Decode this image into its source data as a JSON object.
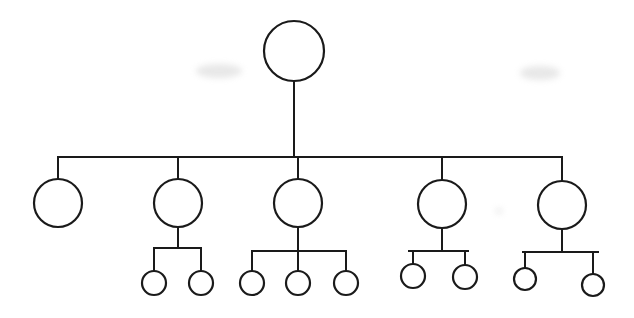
{
  "diagram": {
    "type": "tree",
    "title": "",
    "stroke_color": "#1a1a1a",
    "fill_color": "#ffffff",
    "background": "#ffffff",
    "root": {
      "id": "root",
      "cx": 294,
      "cy": 51,
      "r": 30
    },
    "trunk": {
      "x": 294,
      "y1": 81,
      "y2": 157
    },
    "level1_bar": {
      "y": 157,
      "x1": 58,
      "x2": 562
    },
    "level1": [
      {
        "id": "n1",
        "cx": 58,
        "cy": 203,
        "r": 24,
        "drop_from": 157,
        "children_bar": null,
        "children": []
      },
      {
        "id": "n2",
        "cx": 178,
        "cy": 203,
        "r": 24,
        "drop_from": 157,
        "children_bar": {
          "y": 248,
          "x1": 154,
          "x2": 201
        },
        "children": [
          {
            "cx": 154,
            "cy": 283,
            "r": 12
          },
          {
            "cx": 201,
            "cy": 283,
            "r": 12
          }
        ]
      },
      {
        "id": "n3",
        "cx": 298,
        "cy": 203,
        "r": 24,
        "drop_from": 157,
        "children_bar": {
          "y": 251,
          "x1": 252,
          "x2": 346
        },
        "children": [
          {
            "cx": 252,
            "cy": 283,
            "r": 12
          },
          {
            "cx": 298,
            "cy": 283,
            "r": 12
          },
          {
            "cx": 346,
            "cy": 283,
            "r": 12
          }
        ]
      },
      {
        "id": "n4",
        "cx": 442,
        "cy": 204,
        "r": 24,
        "drop_from": 157,
        "children_bar": {
          "y": 251,
          "x1": 409,
          "x2": 468
        },
        "children": [
          {
            "cx": 413,
            "cy": 276,
            "r": 12
          },
          {
            "cx": 465,
            "cy": 277,
            "r": 12
          }
        ]
      },
      {
        "id": "n5",
        "cx": 562,
        "cy": 205,
        "r": 24,
        "drop_from": 157,
        "children_bar": {
          "y": 252,
          "x1": 523,
          "x2": 598
        },
        "children": [
          {
            "cx": 525,
            "cy": 279,
            "r": 11
          },
          {
            "cx": 593,
            "cy": 285,
            "r": 11
          }
        ]
      }
    ],
    "node_count": 17,
    "labels": []
  }
}
